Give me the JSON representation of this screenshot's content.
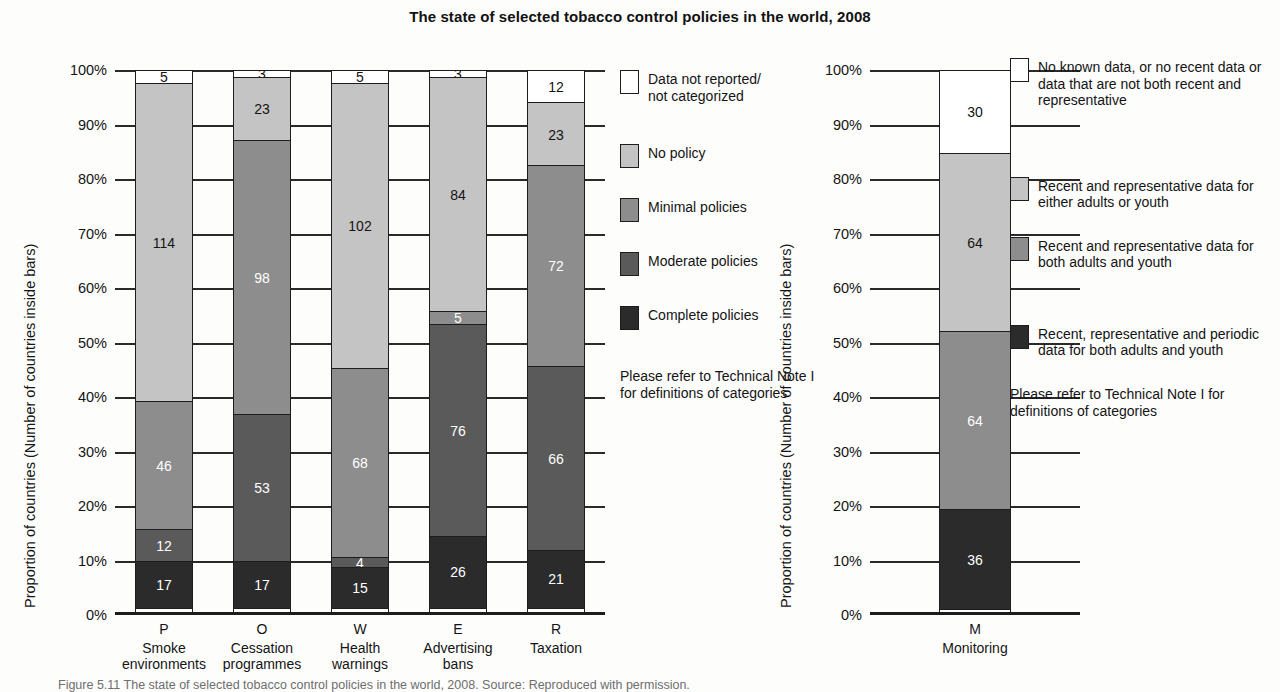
{
  "title": "The state of selected tobacco control policies in the world, 2008",
  "axis_title_left": "Proportion of countries (Number of countries inside bars)",
  "axis_title_right": "Proportion of countries (Number of countries inside bars)",
  "yticks": [
    "100%",
    "90%",
    "80%",
    "70%",
    "60%",
    "50%",
    "40%",
    "30%",
    "20%",
    "10%",
    "0%"
  ],
  "note": "Please refer to Technical Note I for definitions of categories",
  "caption": "Figure 5.11 The state of selected tobacco control policies in the world, 2008. Source: Reproduced with permission.",
  "legend_left": [
    {
      "key": "not-reported",
      "label": "Data not reported/\nnot categorized",
      "fill": "white"
    },
    {
      "key": "no-policy",
      "label": "No policy",
      "fill": "light"
    },
    {
      "key": "minimal",
      "label": "Minimal policies",
      "fill": "mid"
    },
    {
      "key": "moderate",
      "label": "Moderate policies",
      "fill": "dark"
    },
    {
      "key": "complete",
      "label": "Complete policies",
      "fill": "black"
    }
  ],
  "legend_right": [
    {
      "key": "no-known-data",
      "label": "No known data, or no recent data or data that are not both recent and representative",
      "fill": "white"
    },
    {
      "key": "either-adults-or-youth",
      "label": "Recent and representative data for either adults or youth",
      "fill": "light"
    },
    {
      "key": "both-adults-and-youth",
      "label": "Recent and representative data for both adults and youth",
      "fill": "mid"
    },
    {
      "key": "periodic-both",
      "label": "Recent, representative and periodic data for both adults and youth",
      "fill": "black"
    }
  ],
  "chart_data": [
    {
      "id": "policies",
      "type": "bar",
      "stacked": true,
      "normalized": true,
      "title": "The state of selected tobacco control policies in the world, 2008",
      "xlabel": "",
      "ylabel": "Proportion of countries (Number of countries inside bars)",
      "ylim": [
        0,
        100
      ],
      "ytick_labels": [
        "0%",
        "10%",
        "20%",
        "30%",
        "40%",
        "50%",
        "60%",
        "70%",
        "80%",
        "90%",
        "100%"
      ],
      "grid": true,
      "legend_position": "right",
      "total_countries": 194,
      "categories": [
        {
          "code": "P",
          "name": "Smoke environments"
        },
        {
          "code": "O",
          "name": "Cessation programmes"
        },
        {
          "code": "W",
          "name": "Health warnings"
        },
        {
          "code": "E",
          "name": "Advertising bans"
        },
        {
          "code": "R",
          "name": "Taxation"
        }
      ],
      "series": [
        {
          "name": "Data not reported/not categorized",
          "fill": "white",
          "values": [
            5,
            3,
            5,
            3,
            12
          ]
        },
        {
          "name": "No policy",
          "fill": "light",
          "values": [
            114,
            23,
            102,
            84,
            23
          ]
        },
        {
          "name": "Minimal policies",
          "fill": "mid",
          "values": [
            46,
            98,
            68,
            5,
            72
          ]
        },
        {
          "name": "Moderate policies",
          "fill": "dark",
          "values": [
            12,
            53,
            4,
            76,
            66
          ]
        },
        {
          "name": "Complete policies",
          "fill": "black",
          "values": [
            17,
            17,
            15,
            26,
            21
          ]
        }
      ]
    },
    {
      "id": "monitoring",
      "type": "bar",
      "stacked": true,
      "normalized": true,
      "title": "",
      "xlabel": "",
      "ylabel": "Proportion of countries (Number of countries inside bars)",
      "ylim": [
        0,
        100
      ],
      "ytick_labels": [
        "0%",
        "10%",
        "20%",
        "30%",
        "40%",
        "50%",
        "60%",
        "70%",
        "80%",
        "90%",
        "100%"
      ],
      "grid": true,
      "legend_position": "right",
      "total_countries": 194,
      "categories": [
        {
          "code": "M",
          "name": "Monitoring"
        }
      ],
      "series": [
        {
          "name": "No known data, or no recent data or data that are not both recent and representative",
          "fill": "white",
          "values": [
            30
          ]
        },
        {
          "name": "Recent and representative data for either adults or youth",
          "fill": "light",
          "values": [
            64
          ]
        },
        {
          "name": "Recent and representative data for both adults and youth",
          "fill": "mid",
          "values": [
            64
          ]
        },
        {
          "name": "Recent, representative and periodic data for both adults and youth",
          "fill": "black",
          "values": [
            36
          ]
        }
      ]
    }
  ]
}
